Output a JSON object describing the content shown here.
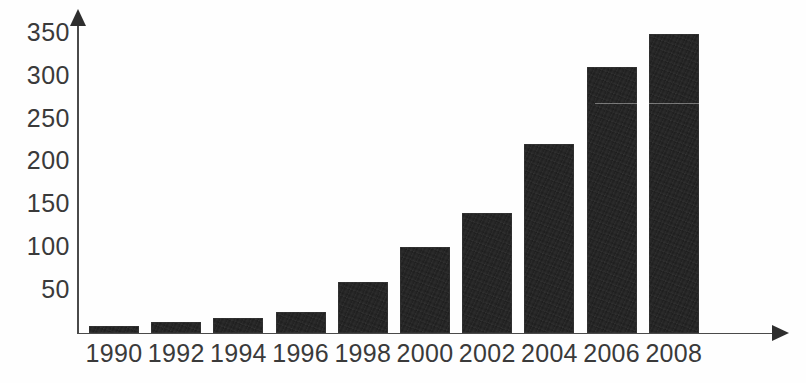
{
  "chart_data": {
    "type": "bar",
    "title": "",
    "subtitle": "",
    "xlabel": "",
    "ylabel": "",
    "categories": [
      "1990",
      "1992",
      "1994",
      "1996",
      "1998",
      "2000",
      "2002",
      "2004",
      "2006",
      "2008"
    ],
    "values": [
      8,
      13,
      18,
      25,
      60,
      100,
      140,
      220,
      310,
      348
    ],
    "series": [
      {
        "name": "",
        "values": [
          8,
          13,
          18,
          25,
          60,
          100,
          140,
          220,
          310,
          348
        ]
      }
    ],
    "ylim": [
      0,
      365
    ],
    "ytick_labels": [
      "50",
      "100",
      "150",
      "200",
      "250",
      "300",
      "350"
    ],
    "ytick_values": [
      50,
      100,
      150,
      200,
      250,
      300,
      350
    ],
    "xtick_labels": [
      "1990",
      "1992",
      "1994",
      "1996",
      "1998",
      "2000",
      "2002",
      "2004",
      "2006",
      "2008"
    ],
    "grid": false,
    "legend": null,
    "legend_position": "none",
    "annotations": [],
    "bar_color": "#1d1d1d",
    "axis_color": "#4a4a4a",
    "background_color": "#fefefe"
  },
  "axes": {
    "y_axis_name": "y-axis",
    "x_axis_name": "x-axis",
    "y_arrow": "arrow-up",
    "x_arrow": "arrow-right"
  }
}
